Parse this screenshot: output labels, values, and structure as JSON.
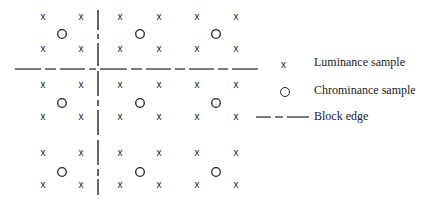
{
  "diagram": {
    "luminance_rows_y": [
      17,
      49,
      85,
      117,
      153,
      185
    ],
    "luminance_cols_x": [
      43,
      81,
      120,
      159,
      197,
      236
    ],
    "chrominance_rows_y": [
      34,
      103,
      172
    ],
    "chrominance_cols_x": [
      62,
      140,
      216
    ],
    "block_edge": {
      "horizontal_y": 69,
      "vertical_x": 98
    },
    "luminance_glyph": "x",
    "chrominance_glyph": "O"
  },
  "legend": {
    "luminance": {
      "symbol": "x",
      "label": "Luminance sample"
    },
    "chrominance": {
      "symbol": "O",
      "label": "Chrominance sample"
    },
    "block_edge": {
      "label": "Block edge"
    }
  }
}
